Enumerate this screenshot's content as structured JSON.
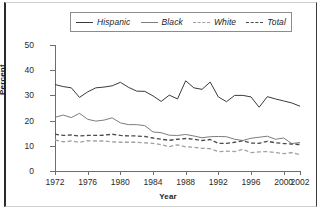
{
  "chart_data": {
    "type": "line",
    "title": "",
    "xlabel": "Year",
    "ylabel": "Percent",
    "xlim": [
      1972,
      2002
    ],
    "ylim": [
      0,
      50
    ],
    "yticks": [
      0,
      10,
      20,
      30,
      40,
      50
    ],
    "xticks": [
      1972,
      1976,
      1980,
      1984,
      1988,
      1992,
      1996,
      2000,
      2002
    ],
    "grid": false,
    "legend_position": "top",
    "x": [
      1972,
      1973,
      1974,
      1975,
      1976,
      1977,
      1978,
      1979,
      1980,
      1981,
      1982,
      1983,
      1984,
      1985,
      1986,
      1987,
      1988,
      1989,
      1990,
      1991,
      1992,
      1993,
      1994,
      1995,
      1996,
      1997,
      1998,
      1999,
      2000,
      2001,
      2002
    ],
    "series": [
      {
        "name": "Hispanic",
        "style": "solid",
        "color": "#3b3b3b",
        "values": [
          34.3,
          33.5,
          33.0,
          29.2,
          31.4,
          33.0,
          33.3,
          33.8,
          35.2,
          33.2,
          31.7,
          31.6,
          29.8,
          27.6,
          30.1,
          28.6,
          35.8,
          33.0,
          32.4,
          35.3,
          29.4,
          27.5,
          30.0,
          30.0,
          29.4,
          25.3,
          29.5,
          28.6,
          27.8,
          27.0,
          25.7
        ]
      },
      {
        "name": "Black",
        "style": "solid",
        "color": "#7d7d7d",
        "values": [
          21.3,
          22.2,
          21.2,
          22.9,
          20.5,
          19.8,
          20.2,
          21.1,
          19.1,
          18.4,
          18.4,
          18.0,
          15.5,
          15.2,
          14.2,
          14.1,
          14.5,
          13.9,
          13.2,
          13.6,
          13.7,
          13.6,
          12.6,
          12.1,
          13.0,
          13.4,
          13.8,
          12.6,
          13.1,
          10.9,
          11.3
        ]
      },
      {
        "name": "White",
        "style": "dashed",
        "color": "#a0a0a0",
        "values": [
          12.3,
          11.6,
          11.9,
          11.4,
          12.0,
          11.9,
          11.9,
          11.6,
          11.4,
          11.4,
          11.4,
          11.2,
          11.0,
          10.4,
          9.7,
          10.4,
          9.6,
          9.4,
          9.0,
          8.9,
          7.7,
          7.9,
          7.7,
          8.6,
          7.3,
          7.6,
          7.7,
          7.3,
          6.9,
          7.3,
          6.5
        ]
      },
      {
        "name": "Total",
        "style": "dashed",
        "color": "#4a4a4a",
        "values": [
          14.6,
          14.1,
          14.3,
          13.9,
          14.1,
          14.1,
          14.2,
          14.6,
          14.1,
          13.9,
          13.9,
          13.7,
          13.1,
          12.6,
          12.2,
          12.6,
          12.9,
          12.6,
          12.1,
          12.5,
          11.0,
          11.0,
          11.4,
          12.0,
          11.1,
          11.0,
          11.8,
          11.2,
          10.9,
          10.7,
          10.5
        ]
      }
    ]
  },
  "legend": {
    "items": [
      {
        "label": "Hispanic"
      },
      {
        "label": "Black"
      },
      {
        "label": "White"
      },
      {
        "label": "Total"
      }
    ]
  },
  "axes": {
    "ylabel": "Percent",
    "xlabel": "Year",
    "yticks": [
      "50",
      "40",
      "30",
      "20",
      "10",
      "0"
    ],
    "xticks": [
      "1972",
      "1976",
      "1980",
      "1984",
      "1988",
      "1992",
      "1996",
      "2000",
      "2002"
    ]
  }
}
